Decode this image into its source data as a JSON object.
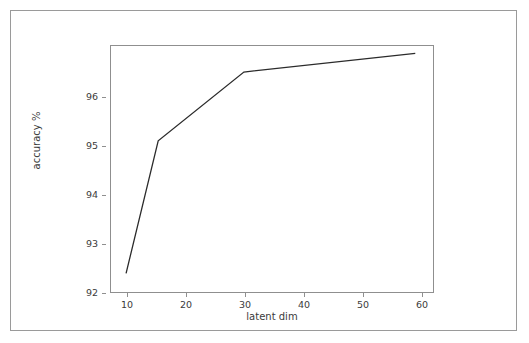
{
  "figure": {
    "background_color": "#ffffff",
    "border_color": "#9a9a9a",
    "line_color": "#2b2b2b",
    "text_color": "#3b3b3b"
  },
  "chart_data": {
    "type": "line",
    "title": "",
    "xlabel": "latent dim",
    "ylabel": "accuracy %",
    "x": [
      10,
      16,
      32,
      64
    ],
    "values": [
      92.2,
      94.9,
      96.3,
      96.68
    ],
    "series": [
      {
        "name": "accuracy",
        "x": [
          10,
          16,
          32,
          64
        ],
        "values": [
          92.2,
          94.9,
          96.3,
          96.68
        ]
      }
    ],
    "xlim": [
      7,
      67.5
    ],
    "ylim": [
      91.8,
      96.85
    ],
    "xticks": [
      10,
      20,
      30,
      40,
      50,
      60
    ],
    "xticklabels": [
      "10",
      "20",
      "30",
      "40",
      "50",
      "60"
    ],
    "yticks": [
      92,
      93,
      94,
      95,
      96
    ],
    "yticklabels": [
      "92",
      "93",
      "94",
      "95",
      "96"
    ],
    "grid": false,
    "legend": null,
    "legend_position": "none",
    "marker": "none",
    "linestyle": "solid"
  }
}
